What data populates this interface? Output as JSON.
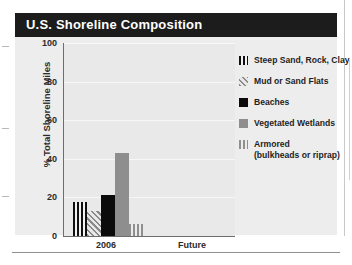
{
  "panel": {
    "title": "U.S. Shoreline Composition"
  },
  "chart_data": {
    "type": "bar",
    "title": "U.S. Shoreline Composition",
    "xlabel": "",
    "ylabel": "% Total Shoreline Miles",
    "ylim": [
      0,
      100
    ],
    "yticks": [
      "0",
      "20",
      "40",
      "60",
      "80",
      "100"
    ],
    "categories": [
      "2006",
      "Future"
    ],
    "grid": true,
    "legend_position": "right",
    "series": [
      {
        "name": "Steep Sand, Rock, Clay",
        "values": [
          17.5,
          null
        ],
        "swatch": "vertical-stripe-dark"
      },
      {
        "name": "Mud or Sand Flats",
        "values": [
          13,
          null
        ],
        "swatch": "diagonal-hatch"
      },
      {
        "name": "Beaches",
        "values": [
          21.5,
          null
        ],
        "swatch": "solid-black"
      },
      {
        "name": "Vegetated Wetlands",
        "values": [
          43,
          null
        ],
        "swatch": "solid-gray"
      },
      {
        "name": "Armored (bulkheads or riprap)",
        "values": [
          6,
          null
        ],
        "swatch": "vertical-stripe-gray"
      }
    ]
  },
  "legend": {
    "items": [
      {
        "label": "Steep Sand, Rock, Clay",
        "label2": ""
      },
      {
        "label": "Mud or Sand Flats",
        "label2": ""
      },
      {
        "label": "Beaches",
        "label2": ""
      },
      {
        "label": "Vegetated Wetlands",
        "label2": ""
      },
      {
        "label": "Armored",
        "label2": "(bulkheads or riprap)"
      }
    ]
  }
}
